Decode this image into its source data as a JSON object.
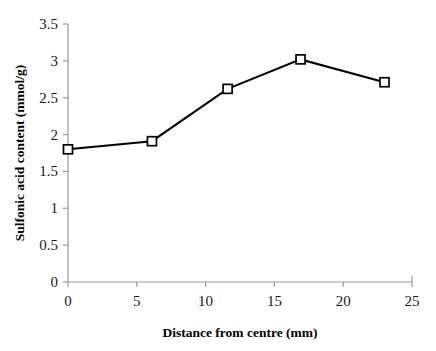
{
  "chart_data": {
    "type": "line",
    "title": "",
    "xlabel": "Distance from centre (mm)",
    "ylabel": "Sulfonic acid content (mmol/g)",
    "xlim": [
      0,
      25
    ],
    "ylim": [
      0,
      3.5
    ],
    "grid": false,
    "legend": false,
    "marker": "open-square",
    "line_color": "#000000",
    "marker_fill": "#ffffff",
    "marker_edge": "#000000",
    "axis_color": "#9a9a9a",
    "xticks": [
      0,
      5,
      10,
      15,
      20,
      25
    ],
    "xtick_labels": [
      "0",
      "5",
      "10",
      "15",
      "20",
      "25"
    ],
    "yticks": [
      0,
      0.5,
      1,
      1.5,
      2,
      2.5,
      3,
      3.5
    ],
    "ytick_labels": [
      "0",
      "0.5",
      "1",
      "1.5",
      "2",
      "2.5",
      "3",
      "3.5"
    ],
    "x": [
      0,
      6.1,
      11.6,
      16.9,
      23.0
    ],
    "values": [
      1.8,
      1.91,
      2.62,
      3.02,
      2.71
    ],
    "series": [
      {
        "name": "Sulfonic acid content",
        "points": [
          {
            "x": 0,
            "y": 1.8
          },
          {
            "x": 6.1,
            "y": 1.91
          },
          {
            "x": 11.6,
            "y": 2.62
          },
          {
            "x": 16.9,
            "y": 3.02
          },
          {
            "x": 23.0,
            "y": 2.71
          }
        ]
      }
    ]
  }
}
